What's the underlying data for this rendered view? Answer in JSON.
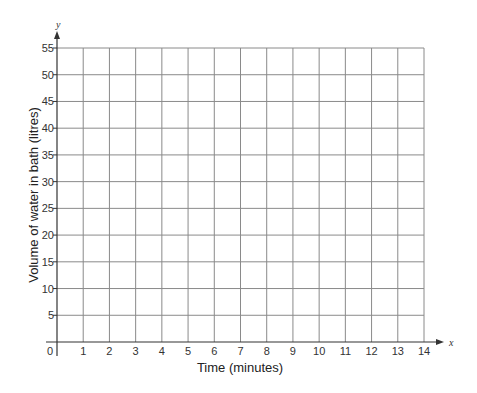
{
  "chart_data": {
    "type": "line",
    "title": "",
    "xlabel": "Time (minutes)",
    "ylabel": "Volume of water in bath (litres)",
    "x_axis_var": "x",
    "y_axis_var": "y",
    "x_ticks": [
      0,
      1,
      2,
      3,
      4,
      5,
      6,
      7,
      8,
      9,
      10,
      11,
      12,
      13,
      14
    ],
    "y_ticks": [
      5,
      10,
      15,
      20,
      25,
      30,
      35,
      40,
      45,
      50,
      55
    ],
    "origin_label": "0",
    "xlim": [
      0,
      14
    ],
    "ylim": [
      0,
      55
    ],
    "grid": true,
    "series": [],
    "legend": null
  },
  "colors": {
    "grid": "#8a8a8a",
    "axis": "#333333",
    "text": "#333333"
  }
}
